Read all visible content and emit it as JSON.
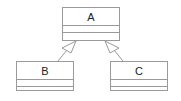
{
  "diagram": {
    "type": "uml-class-diagram",
    "classes": [
      {
        "id": "A",
        "name": "A",
        "x": 62,
        "y": 7,
        "w": 57,
        "h": 34,
        "name_h": 18,
        "attr_h": 7
      },
      {
        "id": "B",
        "name": "B",
        "x": 16,
        "y": 61,
        "w": 57,
        "h": 30,
        "name_h": 18,
        "attr_h": 7
      },
      {
        "id": "C",
        "name": "C",
        "x": 110,
        "y": 61,
        "w": 57,
        "h": 30,
        "name_h": 18,
        "attr_h": 7
      }
    ],
    "relations": [
      {
        "type": "generalization",
        "from": "B",
        "to": "A"
      },
      {
        "type": "generalization",
        "from": "C",
        "to": "A"
      }
    ],
    "colors": {
      "stroke": "#9a9a9a",
      "text": "#222222",
      "background": "#ffffff"
    }
  }
}
